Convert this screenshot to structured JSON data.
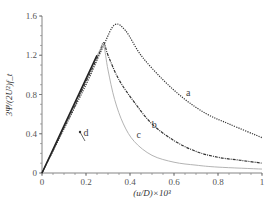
{
  "chart_data": {
    "type": "line",
    "title": "",
    "xlabel": "(u/D)×10³",
    "ylabel": "3Ψ/(2U²)f_t",
    "xlim": [
      0,
      1
    ],
    "ylim": [
      0,
      1.6
    ],
    "x_ticks": [
      "0",
      "0.2",
      "0.4",
      "0.6",
      "0.8",
      "1"
    ],
    "y_ticks": [
      "0",
      "0.4",
      "0.8",
      "1.2",
      "1.6"
    ],
    "grid": false,
    "legend": "inline curve labels",
    "series": [
      {
        "name": "a",
        "style": "dotted",
        "color": "#333333",
        "x": [
          0,
          0.1,
          0.2,
          0.28,
          0.33,
          0.38,
          0.45,
          0.55,
          0.65,
          0.75,
          0.85,
          1.0
        ],
        "y": [
          0,
          0.45,
          0.9,
          1.3,
          1.51,
          1.45,
          1.2,
          0.95,
          0.75,
          0.6,
          0.5,
          0.36
        ]
      },
      {
        "name": "b",
        "style": "dash-dot",
        "color": "#333333",
        "x": [
          0,
          0.1,
          0.2,
          0.26,
          0.28,
          0.3,
          0.35,
          0.42,
          0.5,
          0.6,
          0.7,
          0.8,
          0.9,
          1.0
        ],
        "y": [
          0,
          0.46,
          0.93,
          1.22,
          1.33,
          1.2,
          0.95,
          0.72,
          0.5,
          0.33,
          0.22,
          0.16,
          0.13,
          0.1
        ]
      },
      {
        "name": "c",
        "style": "solid-light",
        "color": "#aaaaaa",
        "x": [
          0,
          0.1,
          0.2,
          0.26,
          0.28,
          0.3,
          0.33,
          0.37,
          0.42,
          0.5,
          0.6,
          0.7,
          0.8,
          1.0
        ],
        "y": [
          0,
          0.47,
          0.95,
          1.24,
          1.3,
          1.05,
          0.75,
          0.5,
          0.32,
          0.18,
          0.11,
          0.08,
          0.06,
          0.04
        ]
      },
      {
        "name": "d",
        "style": "solid",
        "color": "#222222",
        "x": [
          0,
          0.1,
          0.2,
          0.25
        ],
        "y": [
          0,
          0.48,
          0.96,
          1.2
        ]
      }
    ],
    "annotations": [
      {
        "text": "a",
        "x": 0.665,
        "y": 0.78
      },
      {
        "text": "b",
        "x": 0.51,
        "y": 0.46
      },
      {
        "text": "c",
        "x": 0.44,
        "y": 0.36
      },
      {
        "text": "d",
        "x": 0.2,
        "y": 0.38
      }
    ]
  }
}
